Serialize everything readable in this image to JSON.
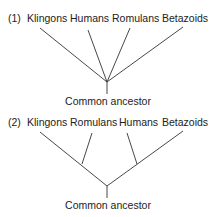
{
  "tree1": {
    "number": "(1)",
    "taxa": [
      "Klingons",
      "Humans",
      "Romulans",
      "Betazoids"
    ],
    "root_label": "Common ancestor"
  },
  "tree2": {
    "number": "(2)",
    "taxa": [
      "Klingons",
      "Romulans",
      "Humans",
      "Betazoids"
    ],
    "root_label": "Common ancestor"
  },
  "line_color": "#333333"
}
